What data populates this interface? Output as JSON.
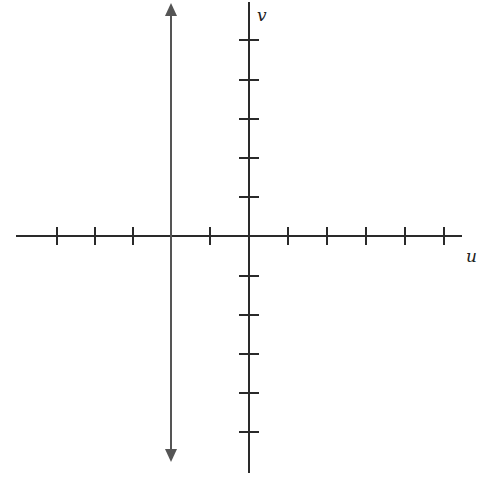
{
  "diagram": {
    "title": "",
    "horizontal_axis": {
      "label": "u",
      "tick_spacing_px": 39,
      "ticks_each_side": 5
    },
    "vertical_axis": {
      "label": "v",
      "tick_spacing_px": 39,
      "ticks_each_side": 5
    },
    "vertical_line": {
      "u_value": -2,
      "arrows": "both",
      "description": "double-headed vertical line u = -2"
    },
    "colors": {
      "axis": "#2a2a2a",
      "line": "#555555",
      "background": "#ffffff"
    }
  }
}
